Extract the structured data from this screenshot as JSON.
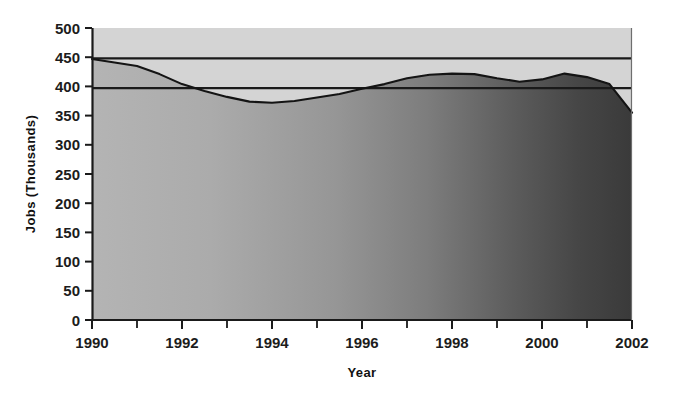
{
  "chart_data": {
    "type": "area",
    "title": "",
    "xlabel": "Year",
    "ylabel": "Jobs (Thousands)",
    "xlim": [
      1990,
      2002
    ],
    "ylim": [
      0,
      500
    ],
    "grid": false,
    "legend": "none",
    "x_tick_labels": [
      "1990",
      "1992",
      "1994",
      "1996",
      "1998",
      "2000",
      "2002"
    ],
    "x_tick_values": [
      1990,
      1992,
      1994,
      1996,
      1998,
      2000,
      2002
    ],
    "x_minor_tick_values": [
      1991,
      1993,
      1995,
      1997,
      1999,
      2001
    ],
    "y_tick_labels": [
      "0",
      "50",
      "100",
      "150",
      "200",
      "250",
      "300",
      "350",
      "400",
      "450",
      "500"
    ],
    "y_tick_values": [
      0,
      50,
      100,
      150,
      200,
      250,
      300,
      350,
      400,
      450,
      500
    ],
    "series": [
      {
        "name": "Jobs",
        "x": [
          1990,
          1990.5,
          1991,
          1991.5,
          1992,
          1992.5,
          1993,
          1993.5,
          1994,
          1994.5,
          1995,
          1995.5,
          1996,
          1996.5,
          1997,
          1997.5,
          1998,
          1998.5,
          1999,
          1999.5,
          2000,
          2000.5,
          2001,
          2001.5,
          2002
        ],
        "values": [
          447,
          441,
          435,
          421,
          404,
          392,
          382,
          374,
          372,
          375,
          381,
          387,
          396,
          404,
          414,
          420,
          422,
          421,
          414,
          408,
          412,
          422,
          416,
          404,
          355
        ]
      }
    ],
    "reference_lines": [
      {
        "name": "upper-reference-line",
        "value": 448
      },
      {
        "name": "lower-reference-line",
        "value": 397
      }
    ],
    "colors": {
      "plot_background": "#d4d4d4",
      "area_fill_left": "#b2b2b2",
      "area_fill_right": "#3d3d3d",
      "axis": "#1a1a1a",
      "curve": "#141414",
      "reference_line": "#1a1a1a",
      "text": "#1c1c1c"
    }
  }
}
